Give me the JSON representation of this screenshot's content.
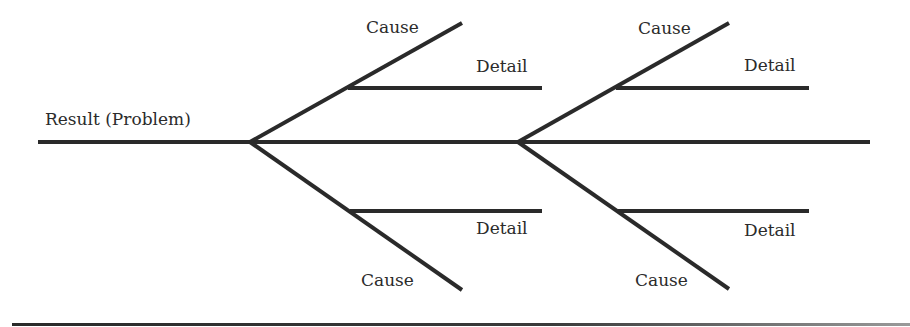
{
  "diagram": {
    "type": "fishbone (Ishikawa) cause-and-effect diagram",
    "result_label": "Result (Problem)",
    "colors": {
      "line": "#2a2a2a",
      "text": "#2b2b2b",
      "background": "#ffffff"
    },
    "causes": [
      {
        "position": "upper-left",
        "label": "Cause",
        "detail_label": "Detail"
      },
      {
        "position": "lower-left",
        "label": "Cause",
        "detail_label": "Detail"
      },
      {
        "position": "upper-right",
        "label": "Cause",
        "detail_label": "Detail"
      },
      {
        "position": "lower-right",
        "label": "Cause",
        "detail_label": "Detail"
      }
    ]
  }
}
